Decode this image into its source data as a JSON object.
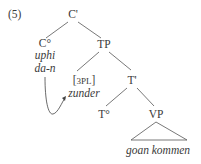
{
  "example_number": "(5)",
  "nodes": {
    "root": "C'",
    "c_head": "C°",
    "tp": "TP",
    "t_bar": "T'",
    "t_head": "T°",
    "vp": "VP"
  },
  "words": {
    "c_word1": "uphi",
    "c_word2": "da-n",
    "subject_feature": "[3PL]",
    "subject": "zunder",
    "vp_content": "goan kommen"
  }
}
